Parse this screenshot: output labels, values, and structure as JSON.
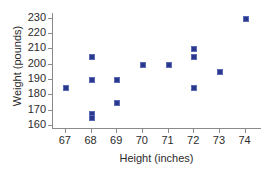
{
  "chart_data": {
    "type": "scatter",
    "title": "",
    "xlabel": "Height (inches)",
    "ylabel": "Weight (pounds)",
    "xlim": [
      66.5,
      74.6
    ],
    "ylim": [
      158,
      233
    ],
    "xticks": [
      67,
      68,
      69,
      70,
      71,
      72,
      73,
      74
    ],
    "yticks": [
      160,
      170,
      180,
      190,
      200,
      210,
      220,
      230
    ],
    "xtick_labels": [
      "67",
      "68",
      "69",
      "70",
      "71",
      "72",
      "73",
      "74"
    ],
    "ytick_labels": [
      "160",
      "170",
      "180",
      "190",
      "200",
      "210",
      "220",
      "230"
    ],
    "grid": false,
    "legend": false,
    "marker_color": "#29388c",
    "axis_color": "#8b8b8b",
    "background": "#ffffff",
    "series": [
      {
        "name": "height-weight",
        "points": [
          {
            "x": 67,
            "y": 185
          },
          {
            "x": 68,
            "y": 205
          },
          {
            "x": 68,
            "y": 190
          },
          {
            "x": 68,
            "y": 168
          },
          {
            "x": 68,
            "y": 165
          },
          {
            "x": 69,
            "y": 190
          },
          {
            "x": 69,
            "y": 175
          },
          {
            "x": 70,
            "y": 200
          },
          {
            "x": 71,
            "y": 200
          },
          {
            "x": 72,
            "y": 210
          },
          {
            "x": 72,
            "y": 205
          },
          {
            "x": 72,
            "y": 185
          },
          {
            "x": 73,
            "y": 195
          },
          {
            "x": 74,
            "y": 230
          }
        ]
      }
    ]
  }
}
